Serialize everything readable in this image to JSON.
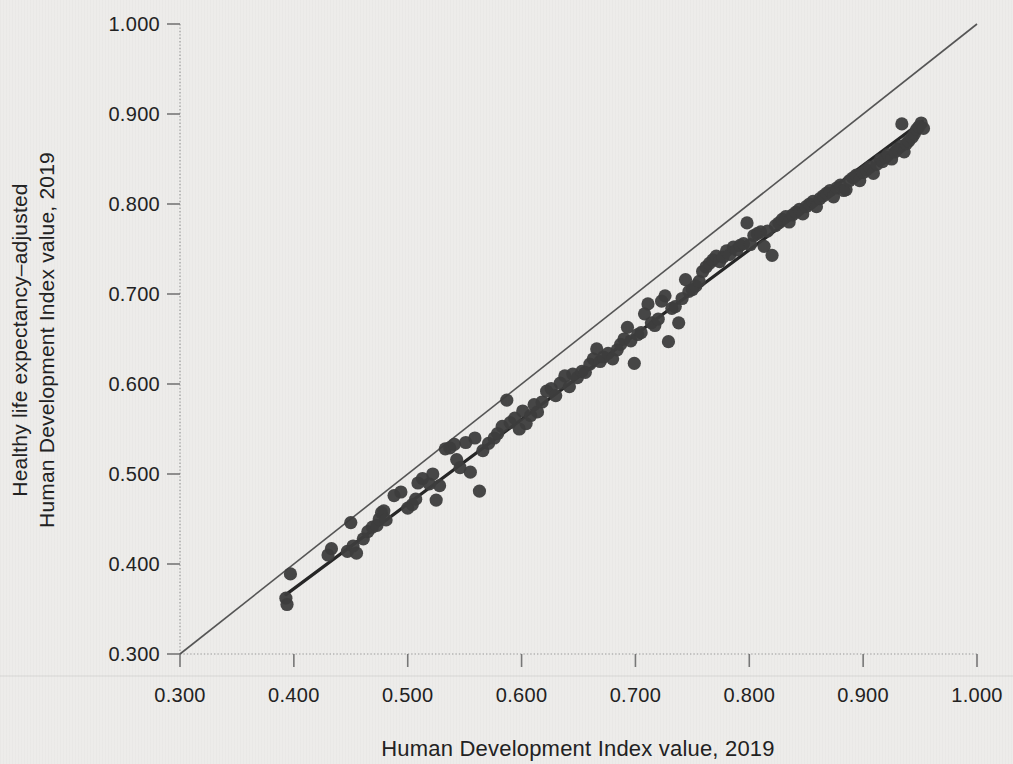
{
  "figure": {
    "x_axis_title": "Human Development Index value, 2019",
    "y_axis_title_line1": "Healthy life expectancy–adjusted",
    "y_axis_title_line2": "Human Development Index value, 2019"
  },
  "chart_data": {
    "type": "scatter",
    "title": "",
    "xlabel": "Human Development Index value, 2019",
    "ylabel": "Healthy life expectancy–adjusted Human Development Index value, 2019",
    "xlim": [
      0.3,
      1.0
    ],
    "ylim": [
      0.3,
      1.0
    ],
    "x_ticks": [
      0.3,
      0.4,
      0.5,
      0.6,
      0.7,
      0.8,
      0.9,
      1.0
    ],
    "y_ticks": [
      0.3,
      0.4,
      0.5,
      0.6,
      0.7,
      0.8,
      0.9,
      1.0
    ],
    "tick_decimals": 3,
    "grid": false,
    "legend": "none",
    "reference_line": {
      "name": "identity-45-degree-line",
      "from": [
        0.3,
        0.3
      ],
      "to": [
        1.0,
        1.0
      ]
    },
    "trend_line": {
      "name": "fit-line",
      "from": [
        0.393,
        0.366
      ],
      "to": [
        0.952,
        0.892
      ]
    },
    "colors": {
      "background": "#edecea",
      "point": "#3d3d3d",
      "trend_line": "#262626",
      "reference_line": "#555555",
      "axis_line": "#999999",
      "tick": "#777777",
      "text": "#222222"
    },
    "series": [
      {
        "name": "countries",
        "points": [
          [
            0.393,
            0.362
          ],
          [
            0.394,
            0.355
          ],
          [
            0.397,
            0.389
          ],
          [
            0.43,
            0.41
          ],
          [
            0.433,
            0.417
          ],
          [
            0.447,
            0.414
          ],
          [
            0.45,
            0.446
          ],
          [
            0.452,
            0.42
          ],
          [
            0.455,
            0.412
          ],
          [
            0.461,
            0.428
          ],
          [
            0.465,
            0.436
          ],
          [
            0.469,
            0.441
          ],
          [
            0.473,
            0.443
          ],
          [
            0.475,
            0.45
          ],
          [
            0.477,
            0.457
          ],
          [
            0.479,
            0.459
          ],
          [
            0.481,
            0.449
          ],
          [
            0.488,
            0.476
          ],
          [
            0.494,
            0.48
          ],
          [
            0.5,
            0.462
          ],
          [
            0.504,
            0.466
          ],
          [
            0.507,
            0.472
          ],
          [
            0.509,
            0.49
          ],
          [
            0.513,
            0.495
          ],
          [
            0.519,
            0.489
          ],
          [
            0.522,
            0.5
          ],
          [
            0.525,
            0.471
          ],
          [
            0.528,
            0.487
          ],
          [
            0.533,
            0.528
          ],
          [
            0.537,
            0.529
          ],
          [
            0.541,
            0.533
          ],
          [
            0.543,
            0.516
          ],
          [
            0.546,
            0.507
          ],
          [
            0.551,
            0.535
          ],
          [
            0.555,
            0.502
          ],
          [
            0.559,
            0.54
          ],
          [
            0.563,
            0.481
          ],
          [
            0.566,
            0.526
          ],
          [
            0.571,
            0.534
          ],
          [
            0.576,
            0.54
          ],
          [
            0.579,
            0.545
          ],
          [
            0.583,
            0.553
          ],
          [
            0.587,
            0.582
          ],
          [
            0.59,
            0.557
          ],
          [
            0.594,
            0.562
          ],
          [
            0.598,
            0.55
          ],
          [
            0.601,
            0.57
          ],
          [
            0.604,
            0.556
          ],
          [
            0.608,
            0.565
          ],
          [
            0.611,
            0.577
          ],
          [
            0.614,
            0.569
          ],
          [
            0.618,
            0.58
          ],
          [
            0.622,
            0.592
          ],
          [
            0.626,
            0.595
          ],
          [
            0.63,
            0.587
          ],
          [
            0.634,
            0.601
          ],
          [
            0.638,
            0.609
          ],
          [
            0.642,
            0.597
          ],
          [
            0.645,
            0.611
          ],
          [
            0.649,
            0.607
          ],
          [
            0.653,
            0.614
          ],
          [
            0.656,
            0.613
          ],
          [
            0.66,
            0.622
          ],
          [
            0.663,
            0.628
          ],
          [
            0.666,
            0.639
          ],
          [
            0.669,
            0.625
          ],
          [
            0.672,
            0.63
          ],
          [
            0.676,
            0.634
          ],
          [
            0.68,
            0.628
          ],
          [
            0.684,
            0.638
          ],
          [
            0.687,
            0.644
          ],
          [
            0.69,
            0.65
          ],
          [
            0.693,
            0.663
          ],
          [
            0.696,
            0.648
          ],
          [
            0.699,
            0.623
          ],
          [
            0.702,
            0.655
          ],
          [
            0.705,
            0.657
          ],
          [
            0.708,
            0.678
          ],
          [
            0.711,
            0.689
          ],
          [
            0.714,
            0.668
          ],
          [
            0.717,
            0.665
          ],
          [
            0.72,
            0.672
          ],
          [
            0.723,
            0.692
          ],
          [
            0.726,
            0.698
          ],
          [
            0.729,
            0.647
          ],
          [
            0.732,
            0.684
          ],
          [
            0.735,
            0.686
          ],
          [
            0.738,
            0.668
          ],
          [
            0.741,
            0.695
          ],
          [
            0.744,
            0.716
          ],
          [
            0.747,
            0.703
          ],
          [
            0.75,
            0.705
          ],
          [
            0.753,
            0.709
          ],
          [
            0.756,
            0.714
          ],
          [
            0.759,
            0.725
          ],
          [
            0.762,
            0.73
          ],
          [
            0.765,
            0.734
          ],
          [
            0.768,
            0.738
          ],
          [
            0.771,
            0.742
          ],
          [
            0.774,
            0.736
          ],
          [
            0.777,
            0.741
          ],
          [
            0.78,
            0.748
          ],
          [
            0.783,
            0.744
          ],
          [
            0.786,
            0.752
          ],
          [
            0.789,
            0.749
          ],
          [
            0.792,
            0.754
          ],
          [
            0.795,
            0.756
          ],
          [
            0.798,
            0.779
          ],
          [
            0.801,
            0.755
          ],
          [
            0.804,
            0.765
          ],
          [
            0.807,
            0.767
          ],
          [
            0.81,
            0.769
          ],
          [
            0.813,
            0.753
          ],
          [
            0.816,
            0.77
          ],
          [
            0.82,
            0.743
          ],
          [
            0.823,
            0.776
          ],
          [
            0.826,
            0.779
          ],
          [
            0.829,
            0.783
          ],
          [
            0.832,
            0.786
          ],
          [
            0.835,
            0.78
          ],
          [
            0.838,
            0.788
          ],
          [
            0.841,
            0.791
          ],
          [
            0.844,
            0.794
          ],
          [
            0.847,
            0.789
          ],
          [
            0.85,
            0.797
          ],
          [
            0.853,
            0.8
          ],
          [
            0.856,
            0.803
          ],
          [
            0.859,
            0.797
          ],
          [
            0.862,
            0.806
          ],
          [
            0.865,
            0.809
          ],
          [
            0.868,
            0.812
          ],
          [
            0.871,
            0.815
          ],
          [
            0.874,
            0.808
          ],
          [
            0.877,
            0.818
          ],
          [
            0.88,
            0.821
          ],
          [
            0.883,
            0.815
          ],
          [
            0.885,
            0.816
          ],
          [
            0.888,
            0.826
          ],
          [
            0.891,
            0.829
          ],
          [
            0.894,
            0.832
          ],
          [
            0.897,
            0.826
          ],
          [
            0.9,
            0.835
          ],
          [
            0.903,
            0.838
          ],
          [
            0.906,
            0.841
          ],
          [
            0.909,
            0.834
          ],
          [
            0.912,
            0.844
          ],
          [
            0.915,
            0.849
          ],
          [
            0.917,
            0.847
          ],
          [
            0.92,
            0.852
          ],
          [
            0.922,
            0.855
          ],
          [
            0.925,
            0.85
          ],
          [
            0.928,
            0.858
          ],
          [
            0.93,
            0.861
          ],
          [
            0.933,
            0.864
          ],
          [
            0.936,
            0.858
          ],
          [
            0.938,
            0.867
          ],
          [
            0.94,
            0.87
          ],
          [
            0.943,
            0.874
          ],
          [
            0.934,
            0.889
          ],
          [
            0.945,
            0.878
          ],
          [
            0.947,
            0.883
          ],
          [
            0.949,
            0.886
          ],
          [
            0.951,
            0.89
          ],
          [
            0.953,
            0.884
          ]
        ]
      }
    ],
    "layout_hints": {
      "plot_area_px": {
        "left": 180,
        "right": 977,
        "top": 24,
        "bottom": 654
      },
      "point_radius_px": 6.6,
      "axis_style": "dotted",
      "tick_length_px": 13
    }
  }
}
